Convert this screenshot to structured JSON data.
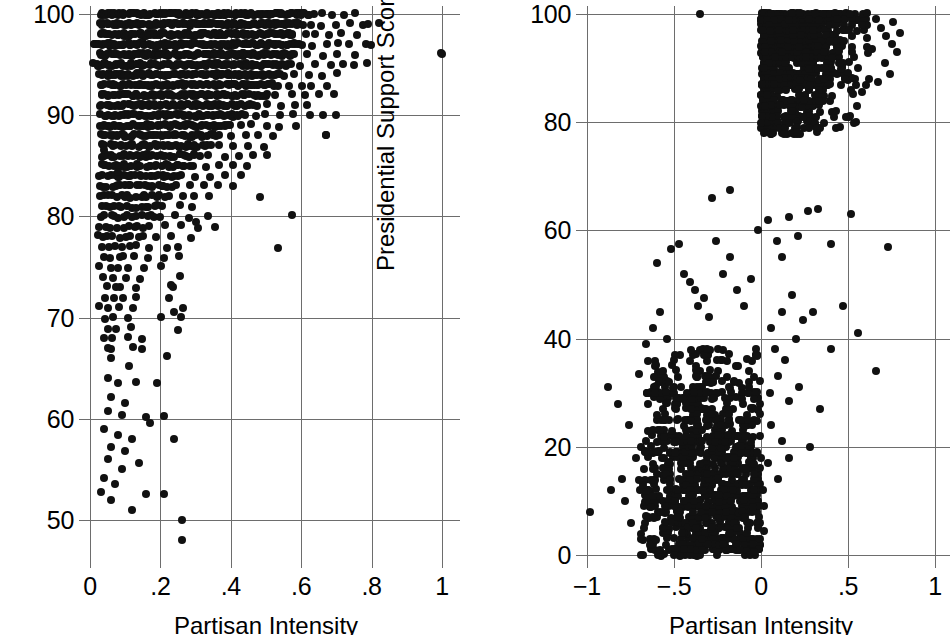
{
  "figure": {
    "panels": [
      "left",
      "right"
    ],
    "background": "#ffffff",
    "marker_color": "#111111",
    "grid_color": "#6d6d6d"
  },
  "left_panel": {
    "xlabel": "Partisan Intensity",
    "ylabel": "Party Unity Score",
    "xticks": [
      "0",
      ".2",
      ".4",
      ".6",
      ".8",
      "1"
    ],
    "yticks": [
      "50",
      "60",
      "70",
      "80",
      "90",
      "100"
    ]
  },
  "right_panel": {
    "xlabel": "Partisan Intensity",
    "ylabel": "Presidential Support Score",
    "xticks": [
      "−1",
      "−.5",
      "0",
      ".5",
      "1"
    ],
    "yticks": [
      "0",
      "20",
      "40",
      "60",
      "80",
      "100"
    ]
  },
  "chart_data": [
    {
      "type": "scatter",
      "id": "left",
      "title": "",
      "xlabel": "Partisan Intensity",
      "ylabel": "Party Unity Score",
      "xlim": [
        0,
        1
      ],
      "ylim": [
        47,
        100.5
      ],
      "xticks": [
        0,
        0.2,
        0.4,
        0.6,
        0.8,
        1
      ],
      "xticklabels": [
        "0",
        ".2",
        ".4",
        ".6",
        ".8",
        "1"
      ],
      "yticks": [
        50,
        60,
        70,
        80,
        90,
        100
      ],
      "yticklabels": [
        "50",
        "60",
        "70",
        "80",
        "90",
        "100"
      ],
      "grid": true,
      "legend": null,
      "marker": "filled-circle",
      "description": "Dense horizontal integer-valued bands of party unity scores from about 84 to 100 spanning partisan intensity 0.02 to 0.6, thinning to the right; sparse scattered points below 84 concentrated at low partisan intensity; one isolated point near intensity 1.",
      "bands": [
        {
          "y": 100,
          "x_from": 0.03,
          "x_to": 0.62,
          "n": 120,
          "extra_x": [
            0.64,
            0.66,
            0.69,
            0.72,
            0.75
          ]
        },
        {
          "y": 99,
          "x_from": 0.03,
          "x_to": 0.6,
          "n": 110,
          "extra_x": [
            0.63,
            0.66,
            0.7,
            0.74,
            0.78,
            0.82
          ]
        },
        {
          "y": 98,
          "x_from": 0.03,
          "x_to": 0.58,
          "n": 100,
          "extra_x": [
            0.61,
            0.64,
            0.68,
            0.71,
            0.76
          ]
        },
        {
          "y": 97,
          "x_from": 0.01,
          "x_to": 0.6,
          "n": 105,
          "extra_x": [
            0.63,
            0.67,
            0.7,
            0.74,
            0.78,
            0.8
          ]
        },
        {
          "y": 96,
          "x_from": 0.03,
          "x_to": 0.58,
          "n": 100,
          "extra_x": [
            0.62,
            0.66,
            0.7,
            0.75,
            1.0
          ]
        },
        {
          "y": 95,
          "x_from": 0.01,
          "x_to": 0.57,
          "n": 95,
          "extra_x": [
            0.6,
            0.64,
            0.68,
            0.72,
            0.79
          ]
        },
        {
          "y": 94,
          "x_from": 0.03,
          "x_to": 0.55,
          "n": 88,
          "extra_x": [
            0.58,
            0.62,
            0.66,
            0.7
          ]
        },
        {
          "y": 93,
          "x_from": 0.03,
          "x_to": 0.53,
          "n": 80,
          "extra_x": [
            0.56,
            0.6,
            0.63,
            0.67
          ]
        },
        {
          "y": 92,
          "x_from": 0.03,
          "x_to": 0.5,
          "n": 72,
          "extra_x": [
            0.53,
            0.57,
            0.61,
            0.65,
            0.69
          ]
        },
        {
          "y": 91,
          "x_from": 0.03,
          "x_to": 0.47,
          "n": 66,
          "extra_x": [
            0.5,
            0.54,
            0.58,
            0.62
          ]
        },
        {
          "y": 90,
          "x_from": 0.03,
          "x_to": 0.44,
          "n": 60,
          "extra_x": [
            0.47,
            0.5,
            0.54,
            0.58,
            0.62,
            0.66
          ]
        },
        {
          "y": 89,
          "x_from": 0.03,
          "x_to": 0.4,
          "n": 52,
          "extra_x": [
            0.43,
            0.46,
            0.5,
            0.54,
            0.58
          ]
        },
        {
          "y": 88,
          "x_from": 0.03,
          "x_to": 0.37,
          "n": 46,
          "extra_x": [
            0.4,
            0.44,
            0.48,
            0.52,
            0.67
          ]
        },
        {
          "y": 87,
          "x_from": 0.03,
          "x_to": 0.34,
          "n": 40,
          "extra_x": [
            0.37,
            0.41,
            0.45,
            0.49
          ]
        },
        {
          "y": 86,
          "x_from": 0.03,
          "x_to": 0.31,
          "n": 34,
          "extra_x": [
            0.34,
            0.38,
            0.42,
            0.46,
            0.5
          ]
        },
        {
          "y": 85,
          "x_from": 0.03,
          "x_to": 0.29,
          "n": 30,
          "extra_x": [
            0.33,
            0.37,
            0.41,
            0.45
          ]
        },
        {
          "y": 84,
          "x_from": 0.03,
          "x_to": 0.26,
          "n": 26,
          "extra_x": [
            0.3,
            0.34,
            0.38,
            0.43
          ]
        },
        {
          "y": 83,
          "x_from": 0.03,
          "x_to": 0.24,
          "n": 22,
          "extra_x": [
            0.28,
            0.32,
            0.36,
            0.41
          ]
        },
        {
          "y": 82,
          "x_from": 0.03,
          "x_to": 0.22,
          "n": 18,
          "extra_x": [
            0.26,
            0.3,
            0.34,
            0.48
          ]
        },
        {
          "y": 81,
          "x_from": 0.03,
          "x_to": 0.21,
          "n": 15,
          "extra_x": [
            0.25,
            0.29
          ]
        },
        {
          "y": 80,
          "x_from": 0.03,
          "x_to": 0.2,
          "n": 14,
          "extra_x": [
            0.24,
            0.28,
            0.33,
            0.57
          ]
        },
        {
          "y": 79,
          "x_from": 0.03,
          "x_to": 0.17,
          "n": 10,
          "extra_x": [
            0.21,
            0.26,
            0.31,
            0.36
          ]
        },
        {
          "y": 78,
          "x_from": 0.02,
          "x_to": 0.15,
          "n": 9,
          "extra_x": [
            0.19,
            0.23,
            0.29
          ]
        },
        {
          "y": 77,
          "x_from": 0.04,
          "x_to": 0.13,
          "n": 6,
          "extra_x": [
            0.17,
            0.22,
            0.53
          ]
        },
        {
          "y": 76,
          "x_from": 0.04,
          "x_to": 0.12,
          "n": 5,
          "extra_x": [
            0.16,
            0.21,
            0.25
          ]
        },
        {
          "y": 75,
          "x_from": 0.03,
          "x_to": 0.11,
          "n": 4,
          "extra_x": [
            0.15,
            0.2
          ]
        },
        {
          "y": 74,
          "x_from": 0.04,
          "x_to": 0.1,
          "n": 3,
          "extra_x": [
            0.14,
            0.25
          ]
        },
        {
          "y": 73,
          "x_from": 0.05,
          "x_to": 0.09,
          "n": 3,
          "extra_x": [
            0.13,
            0.24
          ]
        },
        {
          "y": 72,
          "x_from": 0.04,
          "x_to": 0.09,
          "n": 3,
          "extra_x": [
            0.13,
            0.23
          ]
        },
        {
          "y": 71,
          "x_from": 0.03,
          "x_to": 0.08,
          "n": 3,
          "extra_x": [
            0.12,
            0.26
          ]
        },
        {
          "y": 70,
          "x_from": 0.04,
          "x_to": 0.07,
          "n": 2,
          "extra_x": [
            0.11,
            0.2,
            0.26
          ]
        },
        {
          "y": 69,
          "x_from": 0.05,
          "x_to": 0.07,
          "n": 2,
          "extra_x": [
            0.12
          ]
        },
        {
          "y": 68,
          "x_from": 0.04,
          "x_to": 0.06,
          "n": 2,
          "extra_x": [
            0.11,
            0.15
          ]
        },
        {
          "y": 67,
          "x_from": 0.05,
          "x_to": 0.06,
          "n": 2,
          "extra_x": [
            0.12,
            0.15
          ]
        }
      ],
      "sparse_points": [
        [
          0.06,
          66.0
        ],
        [
          0.11,
          65.2
        ],
        [
          0.05,
          64.0
        ],
        [
          0.08,
          63.5
        ],
        [
          0.13,
          63.6
        ],
        [
          0.19,
          63.5
        ],
        [
          0.06,
          62.2
        ],
        [
          0.1,
          61.6
        ],
        [
          0.05,
          60.8
        ],
        [
          0.09,
          60.4
        ],
        [
          0.16,
          60.2
        ],
        [
          0.21,
          60.3
        ],
        [
          0.04,
          59.0
        ],
        [
          0.08,
          58.4
        ],
        [
          0.12,
          58.0
        ],
        [
          0.06,
          57.2
        ],
        [
          0.1,
          56.8
        ],
        [
          0.05,
          56.0
        ],
        [
          0.14,
          55.6
        ],
        [
          0.09,
          55.0
        ],
        [
          0.04,
          54.2
        ],
        [
          0.07,
          53.6
        ],
        [
          0.03,
          52.8
        ],
        [
          0.06,
          52.0
        ],
        [
          0.26,
          50.0
        ],
        [
          0.26,
          48.0
        ],
        [
          0.16,
          52.6
        ],
        [
          0.21,
          52.6
        ],
        [
          0.12,
          51.0
        ],
        [
          0.04,
          86.6
        ],
        [
          0.04,
          89.0
        ],
        [
          0.08,
          84.4
        ],
        [
          0.25,
          77.0
        ],
        [
          0.3,
          79.4
        ],
        [
          0.23,
          73.2
        ],
        [
          0.24,
          70.6
        ],
        [
          0.25,
          68.8
        ],
        [
          0.22,
          66.2
        ],
        [
          0.17,
          59.6
        ],
        [
          0.24,
          58.0
        ]
      ],
      "outliers": [
        [
          1.0,
          96.0
        ],
        [
          0.79,
          99.0
        ],
        [
          0.75,
          95.0
        ],
        [
          0.7,
          90.0
        ],
        [
          0.67,
          88.0
        ]
      ]
    },
    {
      "type": "scatter",
      "id": "right",
      "title": "",
      "xlabel": "Partisan Intensity",
      "ylabel": "Presidential Support Score",
      "xlim": [
        -1.08,
        1.05
      ],
      "ylim": [
        -2,
        101
      ],
      "xticks": [
        -1,
        -0.5,
        0,
        0.5,
        1
      ],
      "xticklabels": [
        "−1",
        "−.5",
        "0",
        ".5",
        "1"
      ],
      "yticks": [
        0,
        20,
        40,
        60,
        80,
        100
      ],
      "yticklabels": [
        "0",
        "20",
        "40",
        "60",
        "80",
        "100"
      ],
      "grid": true,
      "legend": null,
      "marker": "filled-circle",
      "description": "Strongly bimodal. A dense low cluster with negative partisan intensity between -0.7 and 0 at support scores 0-35, and a very dense high cluster with positive partisan intensity 0 to 0.8 at support scores 78-100. A diagonal sparse bridge of points connects the two clouds.",
      "clusters": [
        {
          "name": "low-left",
          "x_from": -0.7,
          "x_to": 0.0,
          "y_from": 0,
          "y_to": 20,
          "n": 700,
          "x_peak": -0.3,
          "y_peak": 10
        },
        {
          "name": "mid-left",
          "x_from": -0.66,
          "x_to": 0.0,
          "y_from": 20,
          "y_to": 38,
          "n": 330,
          "x_peak": -0.33,
          "y_peak": 27
        },
        {
          "name": "high-right",
          "x_from": 0.0,
          "x_to": 0.62,
          "y_from": 86,
          "y_to": 100,
          "n": 820,
          "x_peak": 0.18,
          "y_peak": 96
        },
        {
          "name": "upper-right-mid",
          "x_from": 0.0,
          "x_to": 0.55,
          "y_from": 78,
          "y_to": 88,
          "n": 260,
          "x_peak": 0.14,
          "y_peak": 83
        }
      ],
      "bridge_points": [
        [
          -0.28,
          66.0
        ],
        [
          -0.18,
          67.5
        ],
        [
          -0.6,
          54.0
        ],
        [
          -0.52,
          56.5
        ],
        [
          -0.47,
          57.5
        ],
        [
          -0.44,
          52.0
        ],
        [
          -0.41,
          50.5
        ],
        [
          -0.38,
          49.0
        ],
        [
          -0.36,
          46.0
        ],
        [
          -0.33,
          47.5
        ],
        [
          -0.3,
          44.0
        ],
        [
          -0.26,
          58.0
        ],
        [
          -0.22,
          52.0
        ],
        [
          -0.18,
          55.0
        ],
        [
          -0.14,
          49.0
        ],
        [
          -0.1,
          46.0
        ],
        [
          -0.06,
          51.0
        ],
        [
          -0.02,
          60.0
        ],
        [
          0.04,
          62.0
        ],
        [
          0.09,
          58.0
        ],
        [
          0.12,
          55.0
        ],
        [
          0.16,
          62.5
        ],
        [
          0.21,
          59.0
        ],
        [
          0.27,
          63.5
        ],
        [
          0.33,
          64.0
        ],
        [
          0.4,
          57.5
        ],
        [
          0.52,
          63.0
        ],
        [
          0.12,
          45.0
        ],
        [
          0.06,
          42.0
        ],
        [
          0.18,
          48.0
        ],
        [
          0.24,
          43.5
        ],
        [
          0.08,
          38.0
        ],
        [
          0.14,
          36.0
        ],
        [
          0.2,
          40.0
        ],
        [
          0.3,
          45.0
        ],
        [
          0.05,
          30.0
        ],
        [
          0.1,
          33.0
        ],
        [
          0.16,
          28.5
        ],
        [
          0.22,
          31.0
        ],
        [
          0.06,
          24.0
        ],
        [
          0.12,
          21.0
        ],
        [
          0.04,
          17.0
        ],
        [
          0.1,
          14.0
        ],
        [
          0.16,
          18.0
        ],
        [
          -0.98,
          8.0
        ],
        [
          -0.35,
          100.0
        ],
        [
          0.73,
          57.0
        ],
        [
          0.66,
          34.0
        ],
        [
          0.56,
          41.0
        ],
        [
          0.47,
          46.0
        ],
        [
          0.4,
          38.0
        ],
        [
          0.34,
          27.0
        ],
        [
          0.28,
          20.0
        ],
        [
          0.02,
          4.5
        ],
        [
          -0.5,
          0.0
        ],
        [
          -0.04,
          0.5
        ],
        [
          0.01,
          12.0
        ],
        [
          0.02,
          9.0
        ],
        [
          -0.8,
          14.0
        ],
        [
          -0.78,
          10.0
        ],
        [
          -0.75,
          6.0
        ],
        [
          -0.72,
          18.0
        ],
        [
          -0.86,
          12.0
        ],
        [
          -0.76,
          24.0
        ],
        [
          -0.82,
          28.0
        ],
        [
          -0.7,
          33.5
        ],
        [
          -0.88,
          31.0
        ],
        [
          -0.66,
          39.0
        ],
        [
          -0.62,
          42.0
        ],
        [
          -0.58,
          45.0
        ],
        [
          -0.54,
          40.0
        ],
        [
          -0.5,
          36.0
        ]
      ],
      "right_edge_points": [
        [
          0.66,
          99.0
        ],
        [
          0.69,
          97.5
        ],
        [
          0.72,
          96.0
        ],
        [
          0.75,
          94.5
        ],
        [
          0.78,
          93.0
        ],
        [
          0.71,
          91.0
        ],
        [
          0.74,
          89.0
        ],
        [
          0.67,
          87.5
        ],
        [
          0.64,
          93.5
        ],
        [
          0.61,
          95.5
        ],
        [
          0.58,
          98.0
        ],
        [
          0.8,
          96.5
        ],
        [
          0.76,
          98.5
        ],
        [
          0.62,
          88.0
        ],
        [
          0.58,
          85.5
        ],
        [
          0.55,
          83.0
        ],
        [
          0.52,
          86.0
        ],
        [
          0.49,
          81.0
        ]
      ]
    }
  ]
}
